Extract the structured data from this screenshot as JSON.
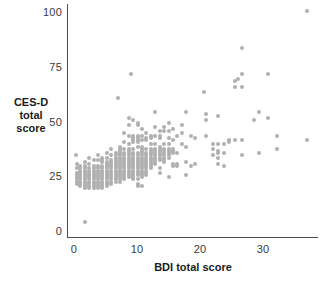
{
  "chart_data": {
    "type": "scatter",
    "title": "",
    "xlabel": "BDI total score",
    "ylabel": "CES-D total score",
    "ylabel_lines": [
      "CES-D",
      "total",
      "score"
    ],
    "xlim": [
      -1,
      39
    ],
    "ylim": [
      -2,
      105
    ],
    "xticks": [
      0,
      10,
      20,
      30
    ],
    "xtick_labels": [
      "0",
      "10",
      "20",
      "30"
    ],
    "yticks": [
      0,
      25,
      50,
      75,
      100
    ],
    "ytick_labels": [
      "0",
      "25",
      "50",
      "75",
      "100"
    ],
    "grid": false,
    "legend": null,
    "marker_color": "#b0b0b0",
    "marker_size_px": 4,
    "axis_color": "#4d4d4d",
    "points": [
      [
        1.8,
        4.5
      ],
      [
        0.3,
        35
      ],
      [
        0.4,
        31
      ],
      [
        0.4,
        29
      ],
      [
        0.4,
        27
      ],
      [
        0.4,
        26
      ],
      [
        0.4,
        25
      ],
      [
        0.4,
        24
      ],
      [
        0.4,
        23
      ],
      [
        0.4,
        22
      ],
      [
        1.0,
        30
      ],
      [
        1.0,
        29
      ],
      [
        1.0,
        28
      ],
      [
        1.0,
        27
      ],
      [
        1.0,
        26
      ],
      [
        1.0,
        25
      ],
      [
        1.0,
        24
      ],
      [
        1.0,
        23
      ],
      [
        1.0,
        22
      ],
      [
        1.0,
        21
      ],
      [
        1.7,
        32
      ],
      [
        1.7,
        30
      ],
      [
        1.7,
        29
      ],
      [
        1.7,
        28
      ],
      [
        1.7,
        27
      ],
      [
        1.7,
        26
      ],
      [
        1.7,
        25
      ],
      [
        1.7,
        24
      ],
      [
        1.7,
        23
      ],
      [
        1.7,
        22
      ],
      [
        1.7,
        21
      ],
      [
        1.7,
        20
      ],
      [
        2.4,
        34
      ],
      [
        2.4,
        31
      ],
      [
        2.4,
        29
      ],
      [
        2.4,
        28
      ],
      [
        2.4,
        27
      ],
      [
        2.4,
        26
      ],
      [
        2.4,
        25
      ],
      [
        2.4,
        24
      ],
      [
        2.4,
        23
      ],
      [
        2.4,
        22
      ],
      [
        2.4,
        21
      ],
      [
        2.4,
        20
      ],
      [
        3.1,
        33
      ],
      [
        3.1,
        30
      ],
      [
        3.1,
        29
      ],
      [
        3.1,
        28
      ],
      [
        3.1,
        27
      ],
      [
        3.1,
        26
      ],
      [
        3.1,
        25
      ],
      [
        3.1,
        24
      ],
      [
        3.1,
        23
      ],
      [
        3.1,
        22
      ],
      [
        3.1,
        21
      ],
      [
        3.1,
        20
      ],
      [
        3.8,
        35
      ],
      [
        3.8,
        33
      ],
      [
        3.8,
        30
      ],
      [
        3.8,
        29
      ],
      [
        3.8,
        28
      ],
      [
        3.8,
        27
      ],
      [
        3.8,
        26
      ],
      [
        3.8,
        25
      ],
      [
        3.8,
        24
      ],
      [
        3.8,
        23
      ],
      [
        3.8,
        22
      ],
      [
        3.8,
        21
      ],
      [
        3.8,
        20
      ],
      [
        4.5,
        34
      ],
      [
        4.5,
        33
      ],
      [
        4.5,
        32
      ],
      [
        4.5,
        30
      ],
      [
        4.5,
        29
      ],
      [
        4.5,
        28
      ],
      [
        4.5,
        27
      ],
      [
        4.5,
        26
      ],
      [
        4.5,
        25
      ],
      [
        4.5,
        24
      ],
      [
        4.5,
        23
      ],
      [
        4.5,
        22
      ],
      [
        4.5,
        21
      ],
      [
        4.5,
        20
      ],
      [
        5.2,
        36
      ],
      [
        5.2,
        34
      ],
      [
        5.2,
        32
      ],
      [
        5.2,
        31
      ],
      [
        5.2,
        30
      ],
      [
        5.2,
        29
      ],
      [
        5.2,
        28
      ],
      [
        5.2,
        27
      ],
      [
        5.2,
        26
      ],
      [
        5.2,
        25
      ],
      [
        5.2,
        24
      ],
      [
        5.2,
        23
      ],
      [
        5.2,
        22
      ],
      [
        5.2,
        21
      ],
      [
        5.9,
        38
      ],
      [
        5.9,
        35
      ],
      [
        5.9,
        33
      ],
      [
        5.9,
        32
      ],
      [
        5.9,
        31
      ],
      [
        5.9,
        30
      ],
      [
        5.9,
        29
      ],
      [
        5.9,
        28
      ],
      [
        5.9,
        27
      ],
      [
        5.9,
        26
      ],
      [
        5.9,
        25
      ],
      [
        5.9,
        24
      ],
      [
        5.9,
        23
      ],
      [
        5.9,
        22
      ],
      [
        6.6,
        36
      ],
      [
        6.6,
        35
      ],
      [
        6.6,
        34
      ],
      [
        6.6,
        33
      ],
      [
        6.6,
        32
      ],
      [
        6.6,
        31
      ],
      [
        6.6,
        30
      ],
      [
        6.6,
        29
      ],
      [
        6.6,
        28
      ],
      [
        6.6,
        27
      ],
      [
        6.6,
        26
      ],
      [
        6.6,
        25
      ],
      [
        6.6,
        24
      ],
      [
        6.6,
        23
      ],
      [
        7.0,
        61
      ],
      [
        7.3,
        39
      ],
      [
        7.3,
        38
      ],
      [
        7.3,
        37
      ],
      [
        7.3,
        36
      ],
      [
        7.3,
        35
      ],
      [
        7.3,
        34
      ],
      [
        7.3,
        33
      ],
      [
        7.3,
        32
      ],
      [
        7.3,
        31
      ],
      [
        7.3,
        30
      ],
      [
        7.3,
        29
      ],
      [
        7.3,
        28
      ],
      [
        7.3,
        27
      ],
      [
        7.3,
        26
      ],
      [
        7.3,
        25
      ],
      [
        7.3,
        24
      ],
      [
        7.3,
        23
      ],
      [
        8.0,
        45
      ],
      [
        8.0,
        41
      ],
      [
        8.0,
        38
      ],
      [
        8.0,
        36
      ],
      [
        8.0,
        35
      ],
      [
        8.0,
        34
      ],
      [
        8.0,
        33
      ],
      [
        8.0,
        32
      ],
      [
        8.0,
        31
      ],
      [
        8.0,
        30
      ],
      [
        8.0,
        29
      ],
      [
        8.0,
        28
      ],
      [
        8.0,
        27
      ],
      [
        8.0,
        26
      ],
      [
        8.0,
        25
      ],
      [
        8.0,
        24
      ],
      [
        8.7,
        52
      ],
      [
        8.7,
        49
      ],
      [
        8.7,
        44
      ],
      [
        8.7,
        40
      ],
      [
        8.7,
        38
      ],
      [
        8.7,
        37
      ],
      [
        8.7,
        36
      ],
      [
        8.7,
        35
      ],
      [
        8.7,
        34
      ],
      [
        8.7,
        33
      ],
      [
        8.7,
        32
      ],
      [
        8.7,
        31
      ],
      [
        8.7,
        30
      ],
      [
        8.7,
        29
      ],
      [
        8.7,
        28
      ],
      [
        8.7,
        27
      ],
      [
        8.7,
        26
      ],
      [
        8.7,
        25
      ],
      [
        9.1,
        72
      ],
      [
        9.4,
        51
      ],
      [
        9.4,
        44
      ],
      [
        9.4,
        43
      ],
      [
        9.4,
        42
      ],
      [
        9.4,
        41
      ],
      [
        9.4,
        38
      ],
      [
        9.4,
        36
      ],
      [
        9.4,
        35
      ],
      [
        9.4,
        34
      ],
      [
        9.4,
        33
      ],
      [
        9.4,
        32
      ],
      [
        9.4,
        31
      ],
      [
        9.4,
        30
      ],
      [
        9.4,
        29
      ],
      [
        9.4,
        28
      ],
      [
        9.4,
        27
      ],
      [
        9.4,
        26
      ],
      [
        9.4,
        25
      ],
      [
        9.4,
        24
      ],
      [
        10.1,
        50
      ],
      [
        10.1,
        49
      ],
      [
        10.1,
        44
      ],
      [
        10.1,
        43
      ],
      [
        10.1,
        42
      ],
      [
        10.1,
        41
      ],
      [
        10.1,
        39
      ],
      [
        10.1,
        36
      ],
      [
        10.1,
        35
      ],
      [
        10.1,
        34
      ],
      [
        10.1,
        33
      ],
      [
        10.1,
        32
      ],
      [
        10.1,
        31
      ],
      [
        10.1,
        30
      ],
      [
        10.1,
        29
      ],
      [
        10.1,
        28
      ],
      [
        10.1,
        27
      ],
      [
        10.1,
        26
      ],
      [
        10.1,
        24
      ],
      [
        10.1,
        22
      ],
      [
        10.1,
        21
      ],
      [
        10.8,
        47
      ],
      [
        10.8,
        44
      ],
      [
        10.8,
        42
      ],
      [
        10.8,
        39
      ],
      [
        10.8,
        38
      ],
      [
        10.8,
        37
      ],
      [
        10.8,
        36
      ],
      [
        10.8,
        35
      ],
      [
        10.8,
        34
      ],
      [
        10.8,
        33
      ],
      [
        10.8,
        32
      ],
      [
        10.8,
        31
      ],
      [
        10.8,
        30
      ],
      [
        10.8,
        29
      ],
      [
        10.8,
        28
      ],
      [
        10.8,
        27
      ],
      [
        10.8,
        26
      ],
      [
        10.8,
        25
      ],
      [
        10.8,
        21
      ],
      [
        11.5,
        45
      ],
      [
        11.5,
        43
      ],
      [
        11.5,
        42
      ],
      [
        11.5,
        38
      ],
      [
        11.5,
        36
      ],
      [
        11.5,
        35
      ],
      [
        11.5,
        34
      ],
      [
        11.5,
        33
      ],
      [
        11.5,
        32
      ],
      [
        11.5,
        31
      ],
      [
        11.5,
        30
      ],
      [
        11.5,
        29
      ],
      [
        11.5,
        28
      ],
      [
        11.5,
        27
      ],
      [
        11.5,
        26
      ],
      [
        12.2,
        44
      ],
      [
        12.2,
        43
      ],
      [
        12.2,
        40
      ],
      [
        12.2,
        38
      ],
      [
        12.2,
        37
      ],
      [
        12.2,
        36
      ],
      [
        12.2,
        35
      ],
      [
        12.2,
        34
      ],
      [
        12.2,
        33
      ],
      [
        12.2,
        32
      ],
      [
        12.2,
        31
      ],
      [
        12.2,
        30
      ],
      [
        12.2,
        29
      ],
      [
        12.9,
        55
      ],
      [
        12.9,
        48
      ],
      [
        12.9,
        44
      ],
      [
        12.9,
        40
      ],
      [
        12.9,
        38
      ],
      [
        12.9,
        37
      ],
      [
        12.9,
        36
      ],
      [
        12.9,
        35
      ],
      [
        12.9,
        34
      ],
      [
        12.9,
        33
      ],
      [
        12.9,
        32
      ],
      [
        12.9,
        31
      ],
      [
        13.6,
        46
      ],
      [
        13.6,
        44
      ],
      [
        13.6,
        43
      ],
      [
        13.6,
        39
      ],
      [
        13.6,
        38
      ],
      [
        13.6,
        37
      ],
      [
        13.6,
        36
      ],
      [
        13.6,
        35
      ],
      [
        13.6,
        34
      ],
      [
        13.6,
        33
      ],
      [
        13.6,
        29
      ],
      [
        13.6,
        27
      ],
      [
        14.3,
        48
      ],
      [
        14.3,
        46
      ],
      [
        14.3,
        40
      ],
      [
        14.3,
        38
      ],
      [
        14.3,
        37
      ],
      [
        14.3,
        36
      ],
      [
        14.3,
        35
      ],
      [
        14.3,
        34
      ],
      [
        14.3,
        33
      ],
      [
        14.3,
        32
      ],
      [
        15.0,
        50
      ],
      [
        15.0,
        46
      ],
      [
        15.0,
        43
      ],
      [
        15.0,
        40
      ],
      [
        15.0,
        38
      ],
      [
        15.0,
        37
      ],
      [
        15.0,
        36
      ],
      [
        15.0,
        35
      ],
      [
        15.0,
        34
      ],
      [
        15.0,
        25
      ],
      [
        15.7,
        47
      ],
      [
        15.7,
        42
      ],
      [
        15.7,
        38
      ],
      [
        15.7,
        37
      ],
      [
        15.7,
        36
      ],
      [
        15.7,
        31
      ],
      [
        15.7,
        30
      ],
      [
        16.4,
        44
      ],
      [
        16.4,
        36
      ],
      [
        16.4,
        31
      ],
      [
        16.4,
        30
      ],
      [
        17.1,
        49
      ],
      [
        17.1,
        45
      ],
      [
        17.1,
        40
      ],
      [
        17.8,
        55
      ],
      [
        17.8,
        39
      ],
      [
        17.8,
        32
      ],
      [
        17.8,
        26
      ],
      [
        18.5,
        44
      ],
      [
        18.5,
        30
      ],
      [
        19.2,
        43
      ],
      [
        19.2,
        31
      ],
      [
        20.6,
        64
      ],
      [
        21.0,
        54
      ],
      [
        21.0,
        51
      ],
      [
        21.0,
        44
      ],
      [
        22.0,
        40
      ],
      [
        22.0,
        38
      ],
      [
        22.0,
        35
      ],
      [
        22.9,
        53
      ],
      [
        22.9,
        40
      ],
      [
        22.9,
        37
      ],
      [
        22.9,
        36
      ],
      [
        22.9,
        34
      ],
      [
        22.9,
        31
      ],
      [
        23.8,
        40
      ],
      [
        23.8,
        36
      ],
      [
        23.8,
        30
      ],
      [
        24.6,
        42
      ],
      [
        24.6,
        41
      ],
      [
        25.6,
        69
      ],
      [
        25.6,
        66
      ],
      [
        25.6,
        42
      ],
      [
        26.1,
        70
      ],
      [
        26.6,
        84
      ],
      [
        26.6,
        72
      ],
      [
        26.6,
        66
      ],
      [
        26.6,
        42
      ],
      [
        26.6,
        35
      ],
      [
        28.6,
        51
      ],
      [
        29.4,
        55
      ],
      [
        29.4,
        36
      ],
      [
        30.8,
        72
      ],
      [
        30.8,
        52
      ],
      [
        32.3,
        44
      ],
      [
        32.3,
        38
      ],
      [
        37.0,
        101
      ],
      [
        37.0,
        42
      ]
    ]
  }
}
